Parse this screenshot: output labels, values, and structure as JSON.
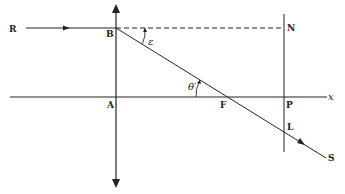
{
  "diagram": {
    "points": {
      "R": "R",
      "B": "B",
      "N": "N",
      "A": "A",
      "F": "F",
      "P": "P",
      "L": "L",
      "S": "S",
      "x": "x"
    },
    "angles": {
      "epsilon": "ε",
      "theta_prime": "θ′"
    },
    "colors": {
      "ink": "#222222",
      "background": "#ffffff"
    }
  }
}
